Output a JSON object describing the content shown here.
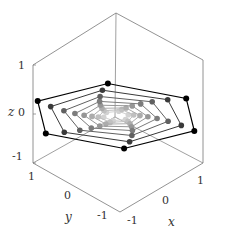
{
  "chart_data": {
    "type": "line3d",
    "title": "",
    "xlabel": "x",
    "ylabel": "y",
    "zlabel": "z",
    "xlim": [
      -1.2,
      1.2
    ],
    "ylim": [
      -1.2,
      1.2
    ],
    "zlim": [
      -1.2,
      1.2
    ],
    "xticks": [
      "-1",
      "0",
      "1"
    ],
    "yticks": [
      "-1",
      "0",
      "1"
    ],
    "zticks": [
      "-1",
      "0",
      "1"
    ],
    "grid": false,
    "ring_count": 8,
    "vertices_per_ring": 6,
    "radii": [
      1.0,
      0.8,
      0.62,
      0.48,
      0.37,
      0.28,
      0.21,
      0.15
    ],
    "colors": [
      "#000000",
      "#3a3a3a",
      "#606060",
      "#7c7c7c",
      "#969696",
      "#acacac",
      "#c0c0c0",
      "#d2d2d2"
    ],
    "twist_deg_per_ring": 6
  },
  "frame": {
    "box_color": "#777777",
    "top": [
      116,
      13
    ],
    "right_top": [
      203,
      60
    ],
    "right_bottom": [
      203,
      163
    ],
    "bottom": [
      120,
      212
    ],
    "left_bottom": [
      33,
      163
    ],
    "left_top": [
      33,
      65
    ],
    "back_center": [
      115,
      117
    ]
  },
  "projection": {
    "origin": [
      116,
      116
    ],
    "ex": [
      41,
      25
    ],
    "ey": [
      -43,
      24
    ],
    "ez": [
      0,
      -52
    ]
  },
  "labels": {
    "z_axis": "z",
    "y_axis": "y",
    "x_axis": "x",
    "z_ticks": [
      "1",
      "0",
      "-1"
    ],
    "y_ticks": [
      "1",
      "0",
      "-1"
    ],
    "x_ticks": [
      "-1",
      "0",
      "1"
    ]
  }
}
